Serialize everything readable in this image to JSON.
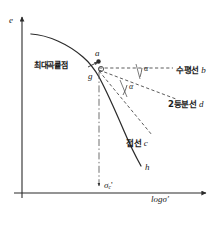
{
  "figure": {
    "axes": {
      "y_label": "e",
      "x_label": "logσ'",
      "x_value_marker": "σ",
      "x_value_marker_sub": "c",
      "x_value_marker_prime": "'"
    },
    "points": {
      "a": "a",
      "g": "g",
      "h": "h"
    },
    "angles": {
      "upper": "α",
      "lower": "α"
    },
    "annotations": {
      "max_curvature_point": "최대곡률점",
      "horizontal_line": "수평선",
      "horizontal_line_id": "b",
      "bisector_line": "2등분선",
      "bisector_line_id": "d",
      "tangent_line": "접선",
      "tangent_line_id": "c"
    },
    "caption": "",
    "colors": {
      "stroke": "#2b2b2b",
      "dashed": "#555555",
      "background": "#ffffff",
      "caption": "#b9b9b9"
    }
  }
}
